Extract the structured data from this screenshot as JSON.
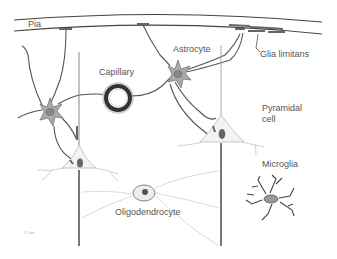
{
  "diagram": {
    "labels": {
      "pia": "Pia",
      "capillary": "Capillary",
      "astrocyte": "Astrocyte",
      "glia_limitans": "Glia limitans",
      "pyramidal_line1": "Pyramidal",
      "pyramidal_line2": "cell",
      "microglia": "Microglia",
      "oligodendrocyte": "Oligodendrocyte",
      "signature": "Z. Cook"
    },
    "colors": {
      "line": "#555555",
      "cell_fill": "#a9a9a9",
      "nucleus": "#777777",
      "light_line": "#cfcfcf",
      "background": "#ffffff"
    }
  }
}
